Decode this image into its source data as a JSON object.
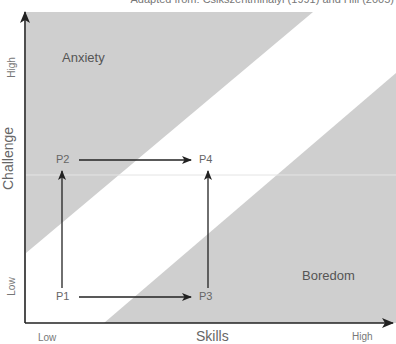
{
  "caption": "Adapted from: Csikszentmihalyi (1991) and Hill (2005)",
  "axes": {
    "x_title": "Skills",
    "y_title": "Challenge",
    "x_low": "Low",
    "x_high": "High",
    "y_low": "Low",
    "y_high": "High"
  },
  "regions": {
    "anxiety": "Anxiety",
    "boredom": "Boredom"
  },
  "points": {
    "p1": "P1",
    "p2": "P2",
    "p3": "P3",
    "p4": "P4"
  },
  "colors": {
    "region_fill": "#cfcfcf",
    "axis": "#222222",
    "arrow": "#222222",
    "text": "#555555"
  }
}
